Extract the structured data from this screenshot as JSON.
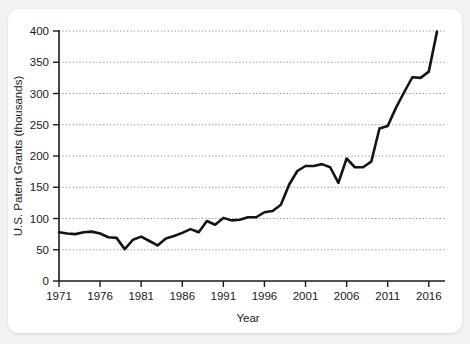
{
  "card": {
    "background": "#ffffff",
    "page_background": "#f2f2f2"
  },
  "chart_data": {
    "type": "line",
    "title": "",
    "xlabel": "Year",
    "ylabel": "U.S. Patent Grants (thousands)",
    "xlim": [
      1971,
      2017
    ],
    "ylim": [
      0,
      400
    ],
    "grid": true,
    "grid_axis": "y",
    "legend": false,
    "line_color": "#141414",
    "xticks": [
      1971,
      1976,
      1981,
      1986,
      1991,
      1996,
      2001,
      2006,
      2011,
      2016
    ],
    "xtick_labels": [
      "1971",
      "1976",
      "1981",
      "1986",
      "1991",
      "1996",
      "2001",
      "2006",
      "2011",
      "2016"
    ],
    "yticks": [
      0,
      50,
      100,
      150,
      200,
      250,
      300,
      350,
      400
    ],
    "ytick_labels": [
      "0",
      "50",
      "100",
      "150",
      "200",
      "250",
      "300",
      "350",
      "400"
    ],
    "series": [
      {
        "name": "U.S. Patent Grants",
        "x": [
          1971,
          1972,
          1973,
          1974,
          1975,
          1976,
          1977,
          1978,
          1979,
          1980,
          1981,
          1982,
          1983,
          1984,
          1985,
          1986,
          1987,
          1988,
          1989,
          1990,
          1991,
          1992,
          1993,
          1994,
          1995,
          1996,
          1997,
          1998,
          1999,
          2000,
          2001,
          2002,
          2003,
          2004,
          2005,
          2006,
          2007,
          2008,
          2009,
          2010,
          2011,
          2012,
          2013,
          2014,
          2015,
          2016,
          2017
        ],
        "values": [
          78,
          76,
          75,
          78,
          79,
          76,
          70,
          69,
          51,
          66,
          71,
          64,
          57,
          68,
          72,
          77,
          83,
          78,
          96,
          90,
          101,
          97,
          98,
          102,
          102,
          110,
          112,
          122,
          154,
          176,
          184,
          184,
          187,
          182,
          157,
          196,
          182,
          182,
          191,
          244,
          248,
          277,
          302,
          326,
          325,
          335,
          399
        ]
      }
    ]
  }
}
